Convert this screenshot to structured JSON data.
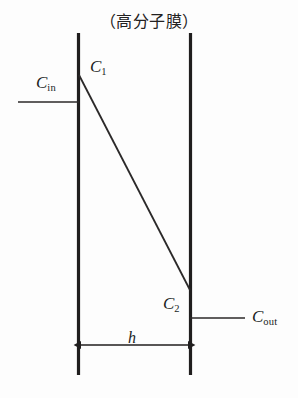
{
  "figure": {
    "title": "（高分子膜）",
    "background_color": "#fdfdfd",
    "line_color": "#201e1e",
    "labels": {
      "c_in": {
        "symbol": "C",
        "subscript": "in"
      },
      "c_1": {
        "symbol": "C",
        "subscript": "1"
      },
      "c_2": {
        "symbol": "C",
        "subscript": "2"
      },
      "c_out": {
        "symbol": "C",
        "subscript": "out"
      },
      "thickness": {
        "symbol": "h"
      }
    },
    "geometry": {
      "left_wall_x": 78,
      "right_wall_x": 191,
      "wall_top_y": 33,
      "wall_bottom_y": 375,
      "profile_start": [
        79,
        75
      ],
      "profile_end": [
        190,
        290
      ],
      "inlet_line_y": 102,
      "inlet_line_x_start": 18,
      "outlet_line_y": 318,
      "outlet_line_x_end": 245,
      "dimension_line_y": 345
    }
  }
}
